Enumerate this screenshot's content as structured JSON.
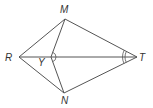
{
  "figure": {
    "type": "geometry-diagram",
    "points": [
      {
        "id": "M",
        "label": "M"
      },
      {
        "id": "R",
        "label": "R"
      },
      {
        "id": "T",
        "label": "T"
      },
      {
        "id": "N",
        "label": "N"
      },
      {
        "id": "Y",
        "label": "Y"
      }
    ],
    "segments": [
      [
        "R",
        "M"
      ],
      [
        "M",
        "T"
      ],
      [
        "R",
        "N"
      ],
      [
        "N",
        "T"
      ],
      [
        "R",
        "T"
      ],
      [
        "M",
        "Y"
      ],
      [
        "N",
        "Y"
      ]
    ],
    "angle_marks": [
      {
        "vertex": "Y",
        "between": [
          "M",
          "T"
        ],
        "arcs": 1
      },
      {
        "vertex": "Y",
        "between": [
          "N",
          "T"
        ],
        "arcs": 1
      },
      {
        "vertex": "T",
        "between": [
          "M",
          "R"
        ],
        "arcs": 2
      },
      {
        "vertex": "T",
        "between": [
          "N",
          "R"
        ],
        "arcs": 2
      }
    ],
    "stroke_color": "#555555",
    "label_color": "#333333"
  }
}
